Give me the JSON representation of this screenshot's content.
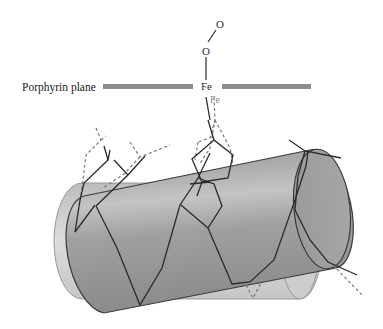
{
  "diagram": {
    "labels": {
      "porphyrin_plane": "Porphyrin plane",
      "fe_bound": "Fe",
      "fe_unbound": "Fe",
      "oxygen_1": "O",
      "oxygen_2": "O"
    },
    "colors": {
      "plane": "#8c8c8c",
      "cylinder_front": "#a8a8a8",
      "cylinder_back": "#cfcfcf",
      "solid_bond": "#2b2b2b",
      "dashed_bond": "#7a7a7a",
      "fe_unbound_text": "#8a8a8a"
    }
  }
}
